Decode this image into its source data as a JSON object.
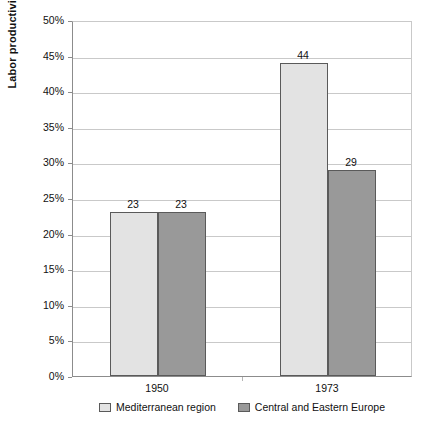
{
  "chart_data": {
    "type": "bar",
    "title": "",
    "subtitle": "",
    "xlabel": "",
    "ylabel": "Labor productivity in % of USA",
    "categories": [
      "1950",
      "1973"
    ],
    "series": [
      {
        "name": "Mediterranean region",
        "values": [
          23,
          44
        ],
        "color": "#e3e3e3"
      },
      {
        "name": "Central and Eastern Europe",
        "values": [
          23,
          29
        ],
        "color": "#999999"
      }
    ],
    "ylim": [
      0,
      50
    ],
    "ytick_step": 5,
    "ytick_labels": [
      "50%",
      "45%",
      "40%",
      "35%",
      "30%",
      "25%",
      "20%",
      "15%",
      "10%",
      "5%",
      "0%"
    ],
    "ytick_values": [
      50,
      45,
      40,
      35,
      30,
      25,
      20,
      15,
      10,
      5,
      0
    ],
    "data_labels": [
      "23",
      "23",
      "44",
      "29"
    ],
    "grid": true,
    "grid_axis": "y",
    "legend_position": "bottom",
    "value_unit": "%",
    "bar_border_color": "#5a5a5a",
    "grid_color": "#c9c9c9",
    "axis_color": "#8c8c8c"
  },
  "legend": {
    "items": [
      {
        "label": "Mediterranean region",
        "swatch": "light"
      },
      {
        "label": "Central and Eastern Europe",
        "swatch": "dark"
      }
    ]
  }
}
